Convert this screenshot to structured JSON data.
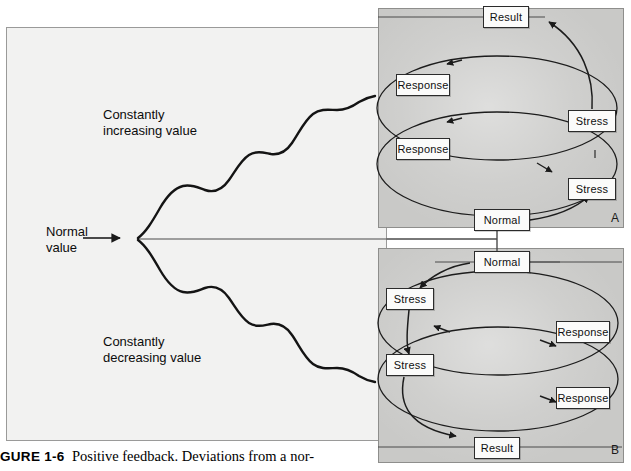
{
  "figure": {
    "caption_lead": "GURE 1-6",
    "caption_body": "Positive feedback. Deviations from a nor-"
  },
  "left_panel": {
    "normal_label": "Normal\nvalue",
    "increasing_label": "Constantly\nincreasing value",
    "decreasing_label": "Constantly\ndecreasing value"
  },
  "panel_a": {
    "letter": "A",
    "nodes": [
      {
        "id": "a-result",
        "label": "Result"
      },
      {
        "id": "a-response-1",
        "label": "Response"
      },
      {
        "id": "a-response-2",
        "label": "Response"
      },
      {
        "id": "a-stress-1",
        "label": "Stress"
      },
      {
        "id": "a-stress-2",
        "label": "Stress"
      },
      {
        "id": "a-normal",
        "label": "Normal"
      }
    ]
  },
  "panel_b": {
    "letter": "B",
    "nodes": [
      {
        "id": "b-normal",
        "label": "Normal"
      },
      {
        "id": "b-stress-1",
        "label": "Stress"
      },
      {
        "id": "b-stress-2",
        "label": "Stress"
      },
      {
        "id": "b-response-1",
        "label": "Response"
      },
      {
        "id": "b-response-2",
        "label": "Response"
      },
      {
        "id": "b-result",
        "label": "Result"
      }
    ]
  },
  "colors": {
    "panel_gray": "#c9c9c7",
    "left_panel_bg": "#f2f2f1",
    "node_fill": "#fbfbfa",
    "stroke": "#1a1a1a"
  }
}
